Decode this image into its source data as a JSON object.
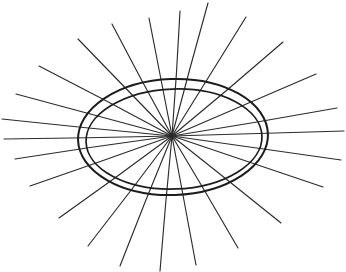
{
  "figure": {
    "kind": "line-drawing",
    "caption": "",
    "background_color": "#ffffff",
    "stroke_color": "#2b2b2b",
    "ellipse_stroke_color": "#1c1c1c",
    "canvas": {
      "width": 346,
      "height": 272
    }
  },
  "chart_data": {
    "type": "scatter",
    "xlabel": "",
    "ylabel": "",
    "grid": false,
    "legend": null,
    "xlim": [
      0,
      346
    ],
    "ylim": [
      0,
      272
    ],
    "center": {
      "x": 172,
      "y": 136
    },
    "ellipse_outer": {
      "cx": 173,
      "cy": 137,
      "rx": 95,
      "ry": 58,
      "rotation_deg": -2
    },
    "ellipse_inner": {
      "cx": 174,
      "cy": 139,
      "rx": 88,
      "ry": 50,
      "rotation_deg": -2
    },
    "spoke_count": 24,
    "spokes": [
      {
        "index": 1,
        "angle_deg": 0,
        "end_x": 344,
        "end_y": 131
      },
      {
        "index": 2,
        "angle_deg": 15,
        "end_x": 337,
        "end_y": 108
      },
      {
        "index": 3,
        "angle_deg": 30,
        "end_x": 316,
        "end_y": 74
      },
      {
        "index": 4,
        "angle_deg": 45,
        "end_x": 283,
        "end_y": 42
      },
      {
        "index": 5,
        "angle_deg": 60,
        "end_x": 246,
        "end_y": 17
      },
      {
        "index": 6,
        "angle_deg": 75,
        "end_x": 208,
        "end_y": 3
      },
      {
        "index": 7,
        "angle_deg": 90,
        "end_x": 180,
        "end_y": 11
      },
      {
        "index": 8,
        "angle_deg": 105,
        "end_x": 149,
        "end_y": 18
      },
      {
        "index": 9,
        "angle_deg": 120,
        "end_x": 112,
        "end_y": 24
      },
      {
        "index": 10,
        "angle_deg": 135,
        "end_x": 78,
        "end_y": 39
      },
      {
        "index": 11,
        "angle_deg": 150,
        "end_x": 39,
        "end_y": 66
      },
      {
        "index": 12,
        "angle_deg": 165,
        "end_x": 16,
        "end_y": 94
      },
      {
        "index": 13,
        "angle_deg": 180,
        "end_x": 2,
        "end_y": 119
      },
      {
        "index": 14,
        "angle_deg": 191,
        "end_x": 4,
        "end_y": 139
      },
      {
        "index": 15,
        "angle_deg": 202,
        "end_x": 15,
        "end_y": 159
      },
      {
        "index": 16,
        "angle_deg": 215,
        "end_x": 30,
        "end_y": 186
      },
      {
        "index": 17,
        "angle_deg": 230,
        "end_x": 59,
        "end_y": 218
      },
      {
        "index": 18,
        "angle_deg": 245,
        "end_x": 88,
        "end_y": 246
      },
      {
        "index": 19,
        "angle_deg": 258,
        "end_x": 120,
        "end_y": 266
      },
      {
        "index": 20,
        "angle_deg": 270,
        "end_x": 160,
        "end_y": 271
      },
      {
        "index": 21,
        "angle_deg": 283,
        "end_x": 196,
        "end_y": 265
      },
      {
        "index": 22,
        "angle_deg": 297,
        "end_x": 238,
        "end_y": 248
      },
      {
        "index": 23,
        "angle_deg": 312,
        "end_x": 281,
        "end_y": 223
      },
      {
        "index": 24,
        "angle_deg": 330,
        "end_x": 323,
        "end_y": 187
      },
      {
        "index": 25,
        "angle_deg": 345,
        "end_x": 341,
        "end_y": 160
      }
    ]
  }
}
